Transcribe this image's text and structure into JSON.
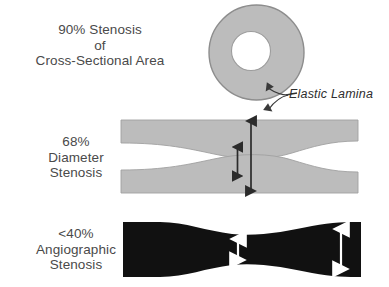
{
  "diagram": {
    "panels": [
      {
        "id": "cross-section",
        "label_lines": [
          "90% Stenosis",
          "of",
          "Cross-Sectional  Area"
        ],
        "percent": "90%",
        "measure": "Cross-Sectional Area",
        "shape": "donut",
        "colors": {
          "wall": "#b9b9b9",
          "wall_outline": "#8a8a8a",
          "lumen": "#ffffff"
        }
      },
      {
        "id": "longitudinal-section",
        "label_lines": [
          "68%",
          "Diameter",
          "Stenosis"
        ],
        "percent": "68%",
        "measure": "Diameter Stenosis",
        "shape": "two-walls-with-lumen",
        "colors": {
          "wall": "#b9b9b9",
          "wall_outline": "#9a9a9a",
          "lumen": "#ffffff",
          "arrow": "#2b2b2b"
        },
        "arrows": [
          {
            "name": "lumen-diameter-arrow",
            "kind": "double-headed",
            "color": "#2b2b2b"
          },
          {
            "name": "vessel-diameter-arrow",
            "kind": "double-headed",
            "color": "#2b2b2b"
          }
        ]
      },
      {
        "id": "angiographic-silhouette",
        "label_lines": [
          "<40%",
          "Angiographic",
          "Stenosis"
        ],
        "percent": "<40%",
        "measure": "Angiographic Stenosis",
        "shape": "filled-lumen-silhouette",
        "colors": {
          "lumen_fill": "#101010",
          "arrow": "#ffffff"
        },
        "arrows": [
          {
            "name": "narrow-segment-arrow",
            "kind": "double-headed",
            "color": "#ffffff"
          },
          {
            "name": "reference-segment-arrow",
            "kind": "double-headed",
            "color": "#ffffff"
          }
        ]
      }
    ],
    "annotation": {
      "name": "elastic-lamina",
      "text": "Elastic Lamina",
      "style": "italic",
      "pointer": "forked-double-arrow"
    }
  }
}
